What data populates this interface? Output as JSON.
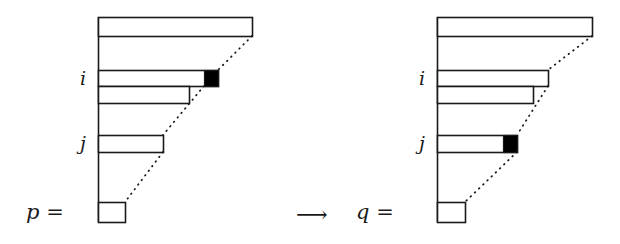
{
  "figure": {
    "transform_arrow": "⟶",
    "colors": {
      "stroke": "#1a1a1a",
      "fill_white": "#ffffff",
      "fill_black": "#000000",
      "background": "#ffffff"
    },
    "diagrams": [
      {
        "name": "p",
        "equals_label": "p =",
        "label_x": 26,
        "label_y": 200,
        "baseline_x": 98,
        "baseline_top": 17,
        "baseline_bottom": 222,
        "row_labels": [
          {
            "text": "i",
            "x": 80,
            "y": 67
          },
          {
            "text": "j",
            "x": 80,
            "y": 132
          }
        ],
        "rows": [
          {
            "name": "row-top",
            "x": 98,
            "y": 17,
            "width": 154,
            "height": 19,
            "marked": false,
            "marked_width": 0
          },
          {
            "name": "row-i",
            "x": 98,
            "y": 70,
            "width": 120,
            "height": 16,
            "marked": true,
            "marked_width": 14
          },
          {
            "name": "row-below-i",
            "x": 98,
            "y": 86,
            "width": 91,
            "height": 17,
            "marked": false,
            "marked_width": 0
          },
          {
            "name": "row-j",
            "x": 98,
            "y": 135,
            "width": 65,
            "height": 17,
            "marked": false,
            "marked_width": 0
          },
          {
            "name": "row-bottom",
            "x": 98,
            "y": 202,
            "width": 27,
            "height": 20,
            "marked": false,
            "marked_width": 0
          }
        ],
        "dotted_segments": [
          {
            "x1": 252,
            "y1": 36,
            "x2": 218,
            "y2": 70
          },
          {
            "x1": 204,
            "y1": 86,
            "x2": 163,
            "y2": 135
          },
          {
            "x1": 163,
            "y1": 152,
            "x2": 125,
            "y2": 202
          }
        ]
      },
      {
        "name": "q",
        "equals_label": "q =",
        "label_x": 356,
        "label_y": 200,
        "baseline_x": 437,
        "baseline_top": 17,
        "baseline_bottom": 222,
        "row_labels": [
          {
            "text": "i",
            "x": 419,
            "y": 67
          },
          {
            "text": "j",
            "x": 419,
            "y": 132
          }
        ],
        "rows": [
          {
            "name": "row-top",
            "x": 437,
            "y": 17,
            "width": 155,
            "height": 19,
            "marked": false,
            "marked_width": 0
          },
          {
            "name": "row-i",
            "x": 437,
            "y": 70,
            "width": 111,
            "height": 16,
            "marked": false,
            "marked_width": 0
          },
          {
            "name": "row-below-i",
            "x": 437,
            "y": 86,
            "width": 96,
            "height": 17,
            "marked": false,
            "marked_width": 0
          },
          {
            "name": "row-j",
            "x": 437,
            "y": 135,
            "width": 80,
            "height": 17,
            "marked": true,
            "marked_width": 14
          },
          {
            "name": "row-bottom",
            "x": 437,
            "y": 202,
            "width": 28,
            "height": 20,
            "marked": false,
            "marked_width": 0
          }
        ],
        "dotted_segments": [
          {
            "x1": 592,
            "y1": 36,
            "x2": 548,
            "y2": 70
          },
          {
            "x1": 548,
            "y1": 86,
            "x2": 517,
            "y2": 135
          },
          {
            "x1": 517,
            "y1": 152,
            "x2": 465,
            "y2": 202
          }
        ]
      }
    ],
    "arrow": {
      "x": 296,
      "y": 202,
      "width": 38
    }
  }
}
